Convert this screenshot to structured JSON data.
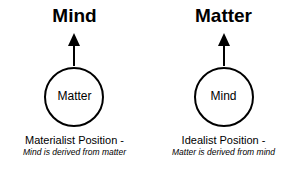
{
  "diagram": {
    "left": {
      "title": "Mind",
      "circle_label": "Matter",
      "caption": "Materialist Position -",
      "subcaption": "Mind is derived from matter"
    },
    "right": {
      "title": "Matter",
      "circle_label": "Mind",
      "caption": "Idealist Position -",
      "subcaption": "Matter is derived from mind"
    },
    "colors": {
      "stroke": "#000000",
      "background": "#ffffff"
    }
  }
}
